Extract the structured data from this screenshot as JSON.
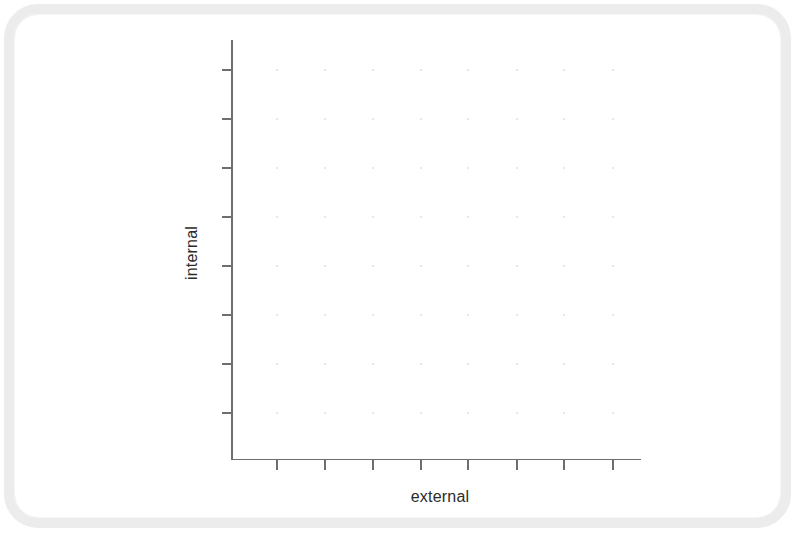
{
  "figure": {
    "background_color": "#ffffff",
    "frame_border_color": "#ececec",
    "axis_color": "#6e6e6e",
    "grid_dot_color": "#e3e3e6",
    "label_color": "#2b2b2b"
  },
  "chart_data": {
    "type": "scatter",
    "title": "",
    "subtitle": "",
    "xlabel": "external",
    "ylabel": "internal",
    "series": [
      {
        "name": "",
        "x": [],
        "y": []
      }
    ],
    "x": [],
    "values": [],
    "categories": [],
    "xtick_labels": [
      "",
      "",
      "",
      "",
      "",
      "",
      "",
      ""
    ],
    "ytick_labels": [
      "",
      "",
      "",
      "",
      "",
      "",
      "",
      ""
    ],
    "xtick_count": 8,
    "ytick_count": 8,
    "xtick_px": [
      277,
      325,
      373,
      421,
      468,
      517,
      564,
      613
    ],
    "ytick_px": [
      70,
      119,
      168,
      217,
      266,
      315,
      364,
      413
    ],
    "grid": true,
    "grid_style": "dotted",
    "legend": null,
    "legend_position": "none",
    "annotations": [],
    "data_points_visible": 0,
    "note": "Empty plot frame: axes, outward tick marks and faint dotted grid are drawn, but no data series are plotted."
  },
  "labels": {
    "y_axis": "internal",
    "x_axis": "external"
  }
}
